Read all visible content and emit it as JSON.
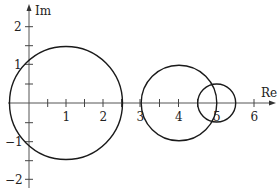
{
  "diagram": {
    "type": "complex-plane",
    "axes": {
      "x_label": "Re",
      "y_label": "Im",
      "x_ticks": [
        1,
        2,
        3,
        4,
        5,
        6
      ],
      "x_tick_labels": [
        "1",
        "2",
        "3",
        "4",
        "5",
        "6"
      ],
      "y_ticks": [
        2,
        1,
        -1,
        -2
      ],
      "y_tick_labels": [
        "2",
        "1",
        "−1",
        "−2"
      ],
      "x_range": [
        -0.5,
        6.6
      ],
      "y_range": [
        -2.3,
        2.6
      ]
    },
    "circles": [
      {
        "center_re": 1,
        "center_im": 0,
        "radius": 1.5
      },
      {
        "center_re": 4,
        "center_im": 0,
        "radius": 1
      },
      {
        "center_re": 5,
        "center_im": 0,
        "radius": 0.5
      }
    ],
    "colors": {
      "stroke": "#1a1a1a",
      "axis": "#555555",
      "background": "#ffffff"
    }
  }
}
